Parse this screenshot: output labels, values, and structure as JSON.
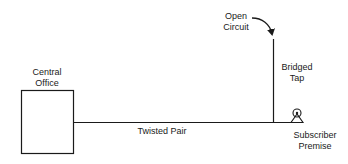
{
  "diagram": {
    "nodes": {
      "central_office": {
        "line1": "Central",
        "line2": "Office"
      },
      "subscriber": {
        "line1": "Subscriber",
        "line2": "Premise"
      }
    },
    "edges": {
      "main_line": {
        "label": "Twisted Pair"
      },
      "tap": {
        "line1": "Bridged",
        "line2": "Tap"
      }
    },
    "annotations": {
      "open_circuit": {
        "line1": "Open",
        "line2": "Circuit"
      }
    },
    "colors": {
      "stroke": "#1a1a1a",
      "background": "#ffffff"
    }
  }
}
